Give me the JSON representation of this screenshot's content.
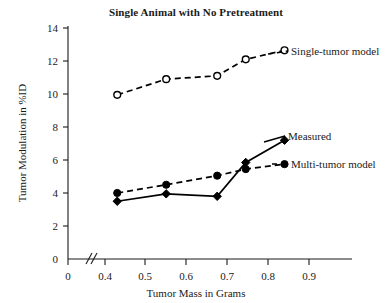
{
  "chart_data": {
    "type": "line",
    "title": "Single Animal with No Pretreatment",
    "xlabel": "Tumor Mass in Grams",
    "ylabel": "Tumor Modulation in %ID",
    "xlim": [
      0.38,
      0.92
    ],
    "ylim": [
      0,
      14
    ],
    "grid": false,
    "legend_position": "inline-right-labels",
    "x_tick_labels": [
      "0",
      "0.4",
      "0.5",
      "0.6",
      "0.7",
      "0.8",
      "0.9"
    ],
    "x_tick_values": [
      0,
      0.4,
      0.5,
      0.6,
      0.7,
      0.8,
      0.9
    ],
    "y_tick_labels": [
      "0",
      "2",
      "4",
      "6",
      "8",
      "10",
      "12",
      "14"
    ],
    "y_tick_values": [
      0,
      2,
      4,
      6,
      8,
      10,
      12,
      14
    ],
    "axis_break": {
      "axis": "x",
      "between": [
        0,
        0.4
      ],
      "symbol": "//"
    },
    "series": [
      {
        "name": "Single-tumor model",
        "marker": "open-circle",
        "line_style": "dashed",
        "x": [
          0.43,
          0.55,
          0.675,
          0.745,
          0.84
        ],
        "values": [
          9.95,
          10.9,
          11.1,
          12.1,
          12.65
        ]
      },
      {
        "name": "Measured",
        "marker": "filled-diamond",
        "line_style": "solid",
        "x": [
          0.43,
          0.55,
          0.675,
          0.745,
          0.84
        ],
        "values": [
          3.5,
          3.95,
          3.8,
          5.85,
          7.2
        ]
      },
      {
        "name": "Multi-tumor model",
        "marker": "filled-circle",
        "line_style": "dashed",
        "x": [
          0.43,
          0.55,
          0.675,
          0.745,
          0.84
        ],
        "values": [
          4.0,
          4.5,
          5.05,
          5.45,
          5.75
        ]
      }
    ]
  },
  "labels": {
    "single_tumor": "Single-tumor model",
    "measured": "Measured",
    "multi_tumor": "Multi-tumor model"
  }
}
